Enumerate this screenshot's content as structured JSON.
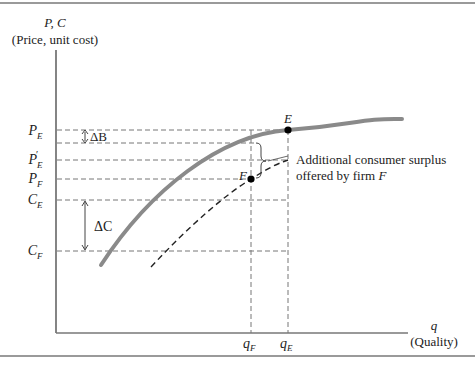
{
  "diagram": {
    "y_axis": {
      "symbol": "P, C",
      "label": "(Price, unit cost)"
    },
    "x_axis": {
      "symbol": "q",
      "label": "(Quality)"
    },
    "y_ticks": [
      {
        "main": "P",
        "sub": "E",
        "prime": ""
      },
      {
        "main": "P",
        "sub": "E",
        "prime": "′"
      },
      {
        "main": "P",
        "sub": "F",
        "prime": ""
      },
      {
        "main": "C",
        "sub": "E",
        "prime": ""
      },
      {
        "main": "C",
        "sub": "F",
        "prime": ""
      }
    ],
    "x_ticks": [
      {
        "main": "q",
        "sub": "F"
      },
      {
        "main": "q",
        "sub": "E"
      }
    ],
    "points": [
      {
        "label": "E"
      },
      {
        "label": "F"
      }
    ],
    "annotations": {
      "delta_b": "ΔB",
      "delta_c": "ΔC",
      "surplus_line1": "Additional consumer surplus",
      "surplus_line2_prefix": "offered by firm ",
      "surplus_line2_italic": "F"
    },
    "colors": {
      "solid_curve": "#8a8a8a",
      "dashed_curve": "#222222",
      "guide_lines": "#777777",
      "axis": "#333333",
      "border": "#999999"
    }
  }
}
